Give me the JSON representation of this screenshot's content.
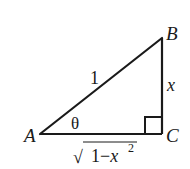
{
  "diagram": {
    "type": "right-triangle",
    "stroke_color": "#1a1a1a",
    "background": "#ffffff",
    "vertices": {
      "A": {
        "label": "A",
        "x": 40,
        "y": 134
      },
      "B": {
        "label": "B",
        "x": 162,
        "y": 38
      },
      "C": {
        "label": "C",
        "x": 162,
        "y": 134
      }
    },
    "right_angle_at": "C",
    "angle_label": "θ",
    "sides": {
      "hypotenuse": {
        "from": "A",
        "to": "B",
        "label": "1"
      },
      "opposite": {
        "from": "B",
        "to": "C",
        "label": "x"
      },
      "adjacent": {
        "from": "A",
        "to": "C",
        "label_radicand": "1−x",
        "label_exponent": "2",
        "label_radical": "√"
      }
    }
  }
}
